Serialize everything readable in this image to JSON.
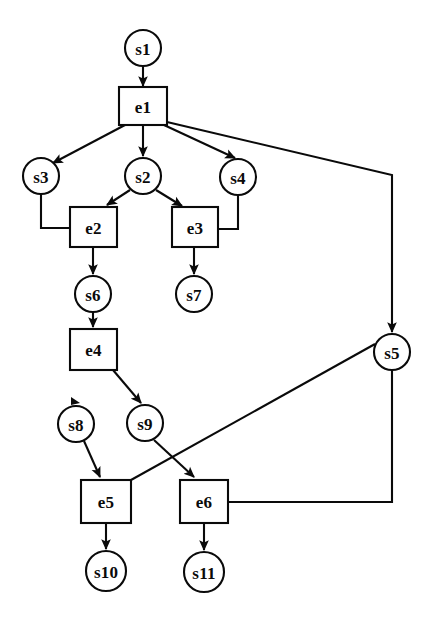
{
  "diagram": {
    "type": "directed-graph",
    "canvas": {
      "width": 432,
      "height": 627
    },
    "style": {
      "background": "#ffffff",
      "stroke": "#0a0a0a",
      "label_color": "#0a0a0a",
      "state_shape": "circle",
      "event_shape": "rectangle"
    },
    "nodes": [
      {
        "id": "s1",
        "label": "s1",
        "kind": "state",
        "cx": 143,
        "cy": 48,
        "r": 18
      },
      {
        "id": "e1",
        "label": "e1",
        "kind": "event",
        "x": 119,
        "y": 87,
        "w": 48,
        "h": 38
      },
      {
        "id": "s3",
        "label": "s3",
        "kind": "state",
        "cx": 41,
        "cy": 176,
        "r": 18
      },
      {
        "id": "s2",
        "label": "s2",
        "kind": "state",
        "cx": 143,
        "cy": 176,
        "r": 18
      },
      {
        "id": "s4",
        "label": "s4",
        "kind": "state",
        "cx": 238,
        "cy": 177,
        "r": 18
      },
      {
        "id": "e2",
        "label": "e2",
        "kind": "event",
        "x": 70,
        "y": 207,
        "w": 47,
        "h": 40
      },
      {
        "id": "e3",
        "label": "e3",
        "kind": "event",
        "x": 172,
        "y": 207,
        "w": 46,
        "h": 40
      },
      {
        "id": "s6",
        "label": "s6",
        "kind": "state",
        "cx": 93,
        "cy": 294,
        "r": 18
      },
      {
        "id": "s7",
        "label": "s7",
        "kind": "state",
        "cx": 194,
        "cy": 294,
        "r": 18
      },
      {
        "id": "e4",
        "label": "e4",
        "kind": "event",
        "x": 70,
        "y": 329,
        "w": 47,
        "h": 41
      },
      {
        "id": "s5",
        "label": "s5",
        "kind": "state",
        "cx": 392,
        "cy": 352,
        "r": 18
      },
      {
        "id": "s8",
        "label": "s8",
        "kind": "state",
        "cx": 76,
        "cy": 424,
        "r": 18
      },
      {
        "id": "s9",
        "label": "s9",
        "kind": "state",
        "cx": 145,
        "cy": 423,
        "r": 18
      },
      {
        "id": "e5",
        "label": "e5",
        "kind": "event",
        "x": 81,
        "y": 480,
        "w": 50,
        "h": 43
      },
      {
        "id": "e6",
        "label": "e6",
        "kind": "event",
        "x": 180,
        "y": 480,
        "w": 48,
        "h": 43
      },
      {
        "id": "s10",
        "label": "s10",
        "kind": "state",
        "cx": 106,
        "cy": 571,
        "r": 20
      },
      {
        "id": "s11",
        "label": "s11",
        "kind": "state",
        "cx": 204,
        "cy": 572,
        "r": 20
      }
    ],
    "edges": [
      {
        "id": "s1-e1",
        "from": "s1",
        "to": "e1",
        "arrow": true,
        "shape": "straight",
        "points": "143,66 143,86"
      },
      {
        "id": "e1-s3",
        "from": "e1",
        "to": "s3",
        "arrow": true,
        "shape": "straight",
        "points": "125,125 53,163"
      },
      {
        "id": "e1-s2",
        "from": "e1",
        "to": "s2",
        "arrow": true,
        "shape": "straight",
        "points": "143,125 143,156"
      },
      {
        "id": "e1-s4",
        "from": "e1",
        "to": "s4",
        "arrow": true,
        "shape": "straight",
        "points": "164,125 235,158"
      },
      {
        "id": "e1-s5",
        "from": "e1",
        "to": "s5",
        "arrow": true,
        "shape": "elbow",
        "points": "167,122 392,175 392,332"
      },
      {
        "id": "s3-e2",
        "from": "s3",
        "to": "e2",
        "arrow": false,
        "shape": "elbow",
        "points": "41,194 41,228 70,228"
      },
      {
        "id": "s2-e2",
        "from": "s2",
        "to": "e2",
        "arrow": true,
        "shape": "straight",
        "points": "130,190 107,205"
      },
      {
        "id": "s2-e3",
        "from": "s2",
        "to": "e3",
        "arrow": true,
        "shape": "straight",
        "points": "156,190 182,206"
      },
      {
        "id": "s4-e3",
        "from": "s4",
        "to": "e3",
        "arrow": false,
        "shape": "elbow",
        "points": "238,195 238,229 218,229"
      },
      {
        "id": "e2-s6",
        "from": "e2",
        "to": "s6",
        "arrow": true,
        "shape": "straight",
        "points": "93,247 93,274"
      },
      {
        "id": "e3-s7",
        "from": "e3",
        "to": "s7",
        "arrow": true,
        "shape": "straight",
        "points": "194,247 194,274"
      },
      {
        "id": "s6-e4",
        "from": "s6",
        "to": "e4",
        "arrow": true,
        "shape": "straight",
        "points": "93,312 93,327"
      },
      {
        "id": "e4-s8",
        "from": "e4",
        "to": "s8",
        "arrow": true,
        "shape": "stub",
        "points": "76,404"
      },
      {
        "id": "e4-s9",
        "from": "e4",
        "to": "s9",
        "arrow": true,
        "shape": "straight",
        "points": "113,370 141,403"
      },
      {
        "id": "s8-e5",
        "from": "s8",
        "to": "e5",
        "arrow": true,
        "shape": "straight",
        "points": "84,441 100,477"
      },
      {
        "id": "s9-e6",
        "from": "s9",
        "to": "e6",
        "arrow": true,
        "shape": "straight",
        "points": "154,440 194,477"
      },
      {
        "id": "s5-e5",
        "from": "s5",
        "to": "e5",
        "arrow": false,
        "shape": "straight",
        "points": "375,344 131,480"
      },
      {
        "id": "e6-s5",
        "from": "e6",
        "to": "s5",
        "arrow": false,
        "shape": "elbow",
        "points": "228,502 392,502 392,370"
      },
      {
        "id": "e5-s10",
        "from": "e5",
        "to": "s10",
        "arrow": true,
        "shape": "straight",
        "points": "106,523 106,549"
      },
      {
        "id": "e6-s11",
        "from": "e6",
        "to": "s11",
        "arrow": true,
        "shape": "straight",
        "points": "204,523 204,550"
      }
    ]
  }
}
